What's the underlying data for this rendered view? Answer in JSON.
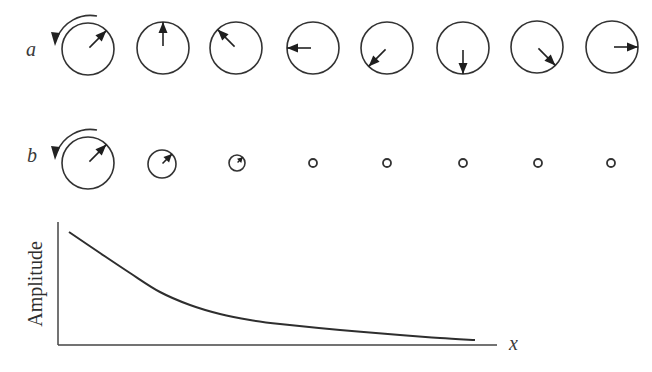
{
  "figure": {
    "row_a": {
      "label": "a",
      "description": "vector rotating, constant amplitude",
      "circles": [
        {
          "cx": 88,
          "cy": 49,
          "r": 26,
          "angle_deg": 45
        },
        {
          "cx": 163,
          "cy": 48,
          "r": 26,
          "angle_deg": 90
        },
        {
          "cx": 236,
          "cy": 48,
          "r": 26,
          "angle_deg": 135
        },
        {
          "cx": 313,
          "cy": 48,
          "r": 26,
          "angle_deg": 180
        },
        {
          "cx": 387,
          "cy": 48,
          "r": 26,
          "angle_deg": 225
        },
        {
          "cx": 463,
          "cy": 48,
          "r": 26,
          "angle_deg": 270
        },
        {
          "cx": 537,
          "cy": 47,
          "r": 26,
          "angle_deg": 315
        },
        {
          "cx": 612,
          "cy": 47,
          "r": 26,
          "angle_deg": 0
        }
      ]
    },
    "row_b": {
      "label": "b",
      "description": "vector rotating, decaying amplitude",
      "circles": [
        {
          "cx": 88,
          "cy": 163,
          "r": 26,
          "angle_deg": 45
        },
        {
          "cx": 162,
          "cy": 164,
          "r": 14,
          "angle_deg": 45
        },
        {
          "cx": 237,
          "cy": 163,
          "r": 8,
          "angle_deg": 45
        },
        {
          "cx": 313,
          "cy": 163,
          "r": 4
        },
        {
          "cx": 387,
          "cy": 163,
          "r": 4
        },
        {
          "cx": 463,
          "cy": 163,
          "r": 4
        },
        {
          "cx": 538,
          "cy": 163,
          "r": 4
        },
        {
          "cx": 611,
          "cy": 163,
          "r": 4
        }
      ]
    }
  },
  "chart_data": {
    "type": "line",
    "title": "",
    "xlabel": "x",
    "ylabel": "Amplitude",
    "grid": false,
    "legend": null,
    "series": [
      {
        "name": "Amplitude decay",
        "x": [
          0,
          0.07,
          0.15,
          0.22,
          0.29,
          0.36,
          0.42,
          0.49,
          0.63,
          0.76,
          0.92,
          1.0
        ],
        "y": [
          1.0,
          0.82,
          0.64,
          0.48,
          0.36,
          0.28,
          0.23,
          0.19,
          0.14,
          0.1,
          0.06,
          0.05
        ]
      }
    ],
    "xlim": [
      0,
      1.05
    ],
    "ylim": [
      0,
      1.1
    ]
  },
  "axes": {
    "origin": [
      58,
      345
    ],
    "y_top": 222,
    "x_end": 497,
    "curve_points": [
      [
        69,
        232
      ],
      [
        100,
        253
      ],
      [
        130,
        273
      ],
      [
        160,
        292
      ],
      [
        190,
        305
      ],
      [
        220,
        314
      ],
      [
        250,
        320
      ],
      [
        280,
        324
      ],
      [
        340,
        330
      ],
      [
        400,
        335
      ],
      [
        440,
        338
      ],
      [
        475,
        340
      ]
    ]
  },
  "colors": {
    "ink": "#333333",
    "background": "#ffffff"
  }
}
